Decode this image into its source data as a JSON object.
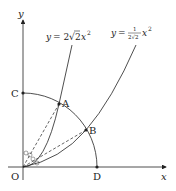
{
  "axes": {
    "x_label": "x",
    "y_label": "y",
    "origin_label": "O"
  },
  "curves": [
    {
      "name": "steep-parabola",
      "equation_prefix": "y = 2",
      "sqrt_arg": "2",
      "equation_suffix": "x",
      "exponent": "2"
    },
    {
      "name": "shallow-parabola",
      "equation_prefix": "y = ",
      "frac_num": "1",
      "frac_den_coef": "2",
      "frac_den_sqrt": "2",
      "equation_suffix": "x",
      "exponent": "2"
    }
  ],
  "points": {
    "A": "A",
    "B": "B",
    "C": "C",
    "D": "D",
    "O": "O"
  },
  "colors": {
    "line": "#222222",
    "background": "#ffffff"
  }
}
